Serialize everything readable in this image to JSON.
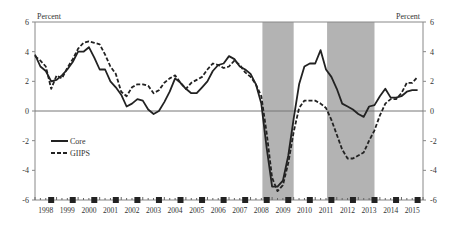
{
  "chart_data": {
    "type": "line",
    "title": "",
    "ylabel_left": "Percent",
    "ylabel_right": "Percent",
    "ylim": [
      -6,
      6
    ],
    "yticks": [
      -6,
      -4,
      -2,
      0,
      2,
      4,
      6
    ],
    "x_tick_labels": [
      "1998",
      "1999",
      "2000",
      "2001",
      "2002",
      "2003",
      "2004",
      "2005",
      "2006",
      "2007",
      "2008",
      "2009",
      "2010",
      "2011",
      "2012",
      "2013",
      "2014",
      "2015"
    ],
    "xlim": [
      1998.0,
      2016.0
    ],
    "grid": false,
    "legend_position": "left-middle",
    "shaded_periods": [
      [
        2008.55,
        2010.0
      ],
      [
        2011.55,
        2013.75
      ]
    ],
    "series": [
      {
        "name": "Core",
        "style": "solid",
        "color": "#222222",
        "x": [
          1998.0,
          1998.25,
          1998.5,
          1998.75,
          1999.0,
          1999.25,
          1999.5,
          1999.75,
          2000.0,
          2000.25,
          2000.5,
          2000.75,
          2001.0,
          2001.25,
          2001.5,
          2001.75,
          2002.0,
          2002.25,
          2002.5,
          2002.75,
          2003.0,
          2003.25,
          2003.5,
          2003.75,
          2004.0,
          2004.25,
          2004.5,
          2004.75,
          2005.0,
          2005.25,
          2005.5,
          2005.75,
          2006.0,
          2006.25,
          2006.5,
          2006.75,
          2007.0,
          2007.25,
          2007.5,
          2007.75,
          2008.0,
          2008.25,
          2008.5,
          2008.75,
          2009.0,
          2009.25,
          2009.5,
          2009.75,
          2010.0,
          2010.25,
          2010.5,
          2010.75,
          2011.0,
          2011.25,
          2011.5,
          2011.75,
          2012.0,
          2012.25,
          2012.5,
          2012.75,
          2013.0,
          2013.25,
          2013.5,
          2013.75,
          2014.0,
          2014.25,
          2014.5,
          2014.75,
          2015.0,
          2015.25,
          2015.5,
          2015.75
        ],
        "values": [
          3.8,
          3.0,
          2.7,
          2.0,
          2.1,
          2.4,
          2.8,
          3.3,
          4.0,
          4.0,
          4.3,
          3.6,
          2.8,
          2.8,
          2.0,
          1.6,
          1.1,
          0.3,
          0.5,
          0.8,
          0.7,
          0.1,
          -0.2,
          0.0,
          0.6,
          1.3,
          2.2,
          1.9,
          1.5,
          1.2,
          1.2,
          1.6,
          2.0,
          2.7,
          3.1,
          3.2,
          3.7,
          3.5,
          3.0,
          2.8,
          2.5,
          1.8,
          0.5,
          -2.5,
          -5.1,
          -5.1,
          -4.7,
          -3.0,
          -0.5,
          1.8,
          3.0,
          3.2,
          3.2,
          4.1,
          2.8,
          2.3,
          1.5,
          0.5,
          0.3,
          0.1,
          -0.2,
          -0.4,
          0.3,
          0.4,
          1.0,
          1.5,
          0.9,
          0.9,
          1.0,
          1.3,
          1.4,
          1.4
        ]
      },
      {
        "name": "GIIPS",
        "style": "dashed",
        "color": "#222222",
        "x": [
          1998.0,
          1998.25,
          1998.5,
          1998.75,
          1999.0,
          1999.25,
          1999.5,
          1999.75,
          2000.0,
          2000.25,
          2000.5,
          2000.75,
          2001.0,
          2001.25,
          2001.5,
          2001.75,
          2002.0,
          2002.25,
          2002.5,
          2002.75,
          2003.0,
          2003.25,
          2003.5,
          2003.75,
          2004.0,
          2004.25,
          2004.5,
          2004.75,
          2005.0,
          2005.25,
          2005.5,
          2005.75,
          2006.0,
          2006.25,
          2006.5,
          2006.75,
          2007.0,
          2007.25,
          2007.5,
          2007.75,
          2008.0,
          2008.25,
          2008.5,
          2008.75,
          2009.0,
          2009.25,
          2009.5,
          2009.75,
          2010.0,
          2010.25,
          2010.5,
          2010.75,
          2011.0,
          2011.25,
          2011.5,
          2011.75,
          2012.0,
          2012.25,
          2012.5,
          2012.75,
          2013.0,
          2013.25,
          2013.5,
          2013.75,
          2014.0,
          2014.25,
          2014.5,
          2014.75,
          2015.0,
          2015.25,
          2015.5,
          2015.75
        ],
        "values": [
          3.7,
          3.4,
          3.0,
          1.5,
          2.4,
          2.2,
          2.9,
          3.5,
          4.2,
          4.6,
          4.7,
          4.6,
          4.5,
          3.8,
          3.0,
          2.5,
          1.3,
          1.0,
          1.6,
          1.8,
          1.8,
          1.7,
          1.2,
          1.4,
          1.9,
          2.2,
          2.4,
          1.9,
          1.5,
          1.9,
          2.1,
          2.3,
          2.8,
          3.2,
          3.1,
          2.9,
          3.0,
          3.4,
          3.1,
          2.6,
          2.3,
          1.8,
          1.0,
          -1.5,
          -4.5,
          -5.4,
          -5.0,
          -3.5,
          -1.4,
          0.2,
          0.7,
          0.7,
          0.7,
          0.5,
          0.2,
          -0.6,
          -1.6,
          -2.6,
          -3.2,
          -3.2,
          -3.0,
          -2.8,
          -2.0,
          -1.3,
          -0.3,
          0.5,
          0.8,
          0.8,
          1.2,
          1.9,
          1.9,
          2.3
        ]
      }
    ],
    "markers": {
      "shape": "square",
      "y": -6,
      "x": [
        1998.75,
        1999.75,
        2000.75,
        2001.75,
        2002.75,
        2003.75,
        2004.75,
        2005.75,
        2006.75,
        2007.75,
        2008.75,
        2009.75,
        2010.75,
        2011.75,
        2012.75,
        2013.75,
        2014.75,
        2015.75
      ]
    }
  },
  "legend": {
    "core": "Core",
    "giips": "GIIPS"
  },
  "axes": {
    "left_unit": "Percent",
    "right_unit": "Percent"
  }
}
